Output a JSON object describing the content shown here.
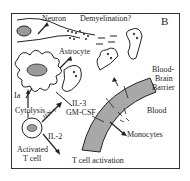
{
  "figure": {
    "panel_label": "B",
    "labels": {
      "neuron": "Neuron",
      "demyelination": "Demyelination?",
      "astrocyte": "Astrocyte",
      "ia": "Ia",
      "cytolysis": "Cytolysis",
      "ifn": "IFN-γ",
      "il3": "IL-3",
      "gmcsf": "GM-CSF",
      "il2": "IL-2",
      "activated": "Activated",
      "tcell": "T cell",
      "tcell_activation": "T cell activation",
      "bbb_1": "Blood-",
      "bbb_2": "Brain",
      "bbb_3": "Barrier",
      "blood": "Blood",
      "monocytes": "Monocytes"
    },
    "colors": {
      "line": "#222222",
      "barrier_fill": "#a8a8a8",
      "nucleus_fill": "#9a9a9a"
    }
  }
}
